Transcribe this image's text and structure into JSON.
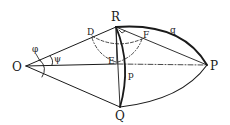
{
  "diagram": {
    "points": {
      "O": {
        "label": "O",
        "x": 26,
        "y": 66
      },
      "R": {
        "label": "R",
        "x": 116,
        "y": 27
      },
      "Q": {
        "label": "Q",
        "x": 120,
        "y": 107
      },
      "P": {
        "label": "P",
        "x": 207,
        "y": 65
      },
      "D": {
        "label": "D",
        "x": 92,
        "y": 36
      },
      "E": {
        "label": "E",
        "x": 116,
        "y": 62
      },
      "F": {
        "label": "F",
        "x": 142,
        "y": 39
      }
    },
    "angle_labels": {
      "phi": "φ",
      "psi": "ψ"
    },
    "arc_labels": {
      "q": "q",
      "p": "p"
    },
    "colors": {
      "ink": "#1a1a1a",
      "background": "#ffffff"
    }
  }
}
